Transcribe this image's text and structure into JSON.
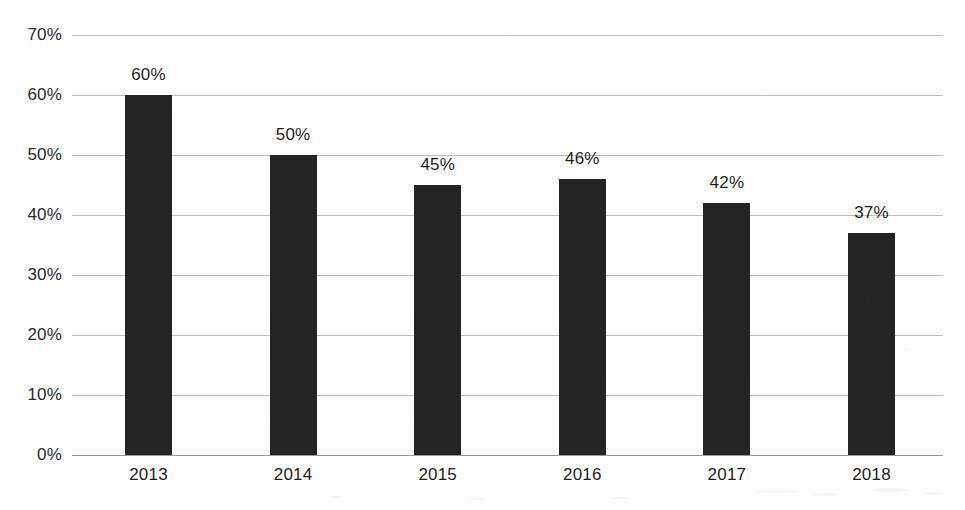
{
  "chart_data": {
    "type": "bar",
    "title": "",
    "subtitle": "",
    "xlabel": "",
    "ylabel": "",
    "categories": [
      "2013",
      "2014",
      "2015",
      "2016",
      "2017",
      "2018"
    ],
    "values": [
      60,
      50,
      45,
      46,
      42,
      37
    ],
    "data_labels": [
      "60%",
      "50%",
      "45%",
      "46%",
      "42%",
      "37%"
    ],
    "ylim": [
      0,
      70
    ],
    "ytick_values": [
      0,
      10,
      20,
      30,
      40,
      50,
      60,
      70
    ],
    "ytick_labels": [
      "0%",
      "10%",
      "20%",
      "30%",
      "40%",
      "50%",
      "60%",
      "70%"
    ],
    "grid": true,
    "grid_axis": "y",
    "legend": false,
    "legend_position": "none",
    "bar_color": "#242424",
    "gridline_color": "#bdbdbd",
    "axis_color": "#9a9a9a",
    "background_color": "#ffffff",
    "text_color": "#1f1f1f",
    "series": [
      {
        "name": "",
        "values": [
          60,
          50,
          45,
          46,
          42,
          37
        ]
      }
    ]
  }
}
